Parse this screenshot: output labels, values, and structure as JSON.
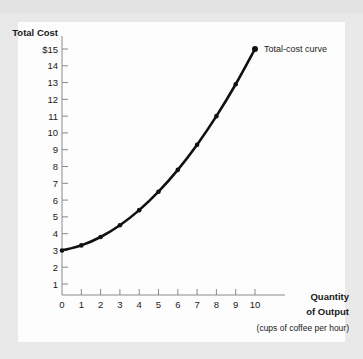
{
  "figure": {
    "background_color": "#e9e9e9",
    "plot_background_color": "#fdfdfd",
    "curve_color": "#111111"
  },
  "axes": {
    "y_title": "Total Cost",
    "x_title_line1": "Quantity",
    "x_title_line2": "of Output",
    "x_title_line3": "(cups of coffee per hour)",
    "y_ticks": [
      "$15",
      "14",
      "13",
      "12",
      "11",
      "10",
      "9",
      "8",
      "7",
      "6",
      "5",
      "4",
      "3",
      "2",
      "1"
    ],
    "x_ticks": [
      "0",
      "1",
      "2",
      "3",
      "4",
      "5",
      "6",
      "7",
      "8",
      "9",
      "10"
    ]
  },
  "annotation": {
    "curve_label": "Total-cost curve"
  },
  "chart_data": {
    "type": "line",
    "title": "",
    "xlabel": "Quantity of Output (cups of coffee per hour)",
    "ylabel": "Total Cost",
    "xlim": [
      0,
      10
    ],
    "ylim": [
      0,
      15
    ],
    "grid": false,
    "legend": "none",
    "markers": true,
    "annotations": [
      "Total-cost curve"
    ],
    "x": [
      0,
      1,
      2,
      3,
      4,
      5,
      6,
      7,
      8,
      9,
      10
    ],
    "series": [
      {
        "name": "Total-cost curve",
        "values": [
          3.0,
          3.3,
          3.8,
          4.5,
          5.4,
          6.5,
          7.8,
          9.3,
          11.0,
          12.9,
          15.0
        ]
      }
    ],
    "x_tick_values": [
      0,
      1,
      2,
      3,
      4,
      5,
      6,
      7,
      8,
      9,
      10
    ],
    "y_tick_values": [
      1,
      2,
      3,
      4,
      5,
      6,
      7,
      8,
      9,
      10,
      11,
      12,
      13,
      14,
      15
    ],
    "currency_prefix_on_top_tick": "$"
  }
}
